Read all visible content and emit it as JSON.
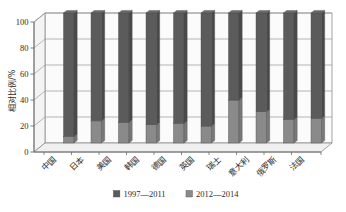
{
  "chart_data": {
    "type": "bar",
    "subtype": "stacked-100-percent-3d-column",
    "title": "",
    "xlabel": "",
    "ylabel": "相对比例/%",
    "ylim": [
      0,
      100
    ],
    "yticks": [
      0,
      20,
      40,
      60,
      80,
      100
    ],
    "ytick_labels": [
      "0",
      "20",
      "40",
      "60",
      "80",
      "100"
    ],
    "grid": true,
    "grid_axis": "y",
    "legend_position": "bottom",
    "categories": [
      "中国",
      "日本",
      "美国",
      "韩国",
      "德国",
      "英国",
      "瑞士",
      "意大利",
      "俄罗斯",
      "法国"
    ],
    "series": [
      {
        "name": "1997—2011",
        "color": "#5b5b5b",
        "values": [
          95,
          83,
          84,
          86,
          85,
          87,
          67,
          76,
          82,
          81
        ]
      },
      {
        "name": "2012—2014",
        "color": "#8a8a8a",
        "values": [
          5,
          17,
          16,
          14,
          15,
          13,
          33,
          24,
          18,
          19
        ]
      }
    ],
    "annotations": []
  },
  "legend": {
    "items": [
      {
        "label": "1997—2011",
        "swatch": "#5b5b5b"
      },
      {
        "label": "2012—2014",
        "swatch": "#8a8a8a"
      }
    ]
  },
  "colors": {
    "background": "#ffffff",
    "axis": "#7a7a7a",
    "grid": "#9a9a9a",
    "floor": "#f2f2f2",
    "wall": "#fbfbfb",
    "text": "#2b2b2b",
    "series_1997_2011": "#5b5b5b",
    "series_2012_2014": "#8a8a8a"
  },
  "icons": {
    "legend_swatch": "legend-swatch-icon"
  }
}
